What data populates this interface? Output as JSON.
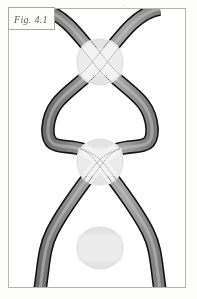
{
  "figure": {
    "label": "Fig. 4.1",
    "label_prefix": "Fig.",
    "label_number": "4.1",
    "alt": "Three-crossing braid diagram with highlighted crossing discs"
  },
  "frame": {
    "x": 8,
    "y": 8,
    "width": 178,
    "height": 280,
    "border_color": "#b4b4b0",
    "background_color": "#ffffff"
  },
  "page": {
    "background_color": "#fdfdfb",
    "width": 197,
    "height": 299
  },
  "colors": {
    "strand_fill": "#8f8f8f",
    "strand_edge_dark": "#141414",
    "strand_fill_light": "#b9b9b9",
    "disc_fill": "#e2e2e2",
    "disc_band": "#efefef",
    "dotted_outline": "#3a3a3a",
    "label_border": "#a8a8a4",
    "label_text": "#5d5d5b"
  },
  "diagram": {
    "type": "braid",
    "strand_count": 2,
    "strand_width": 11,
    "crossing_count": 3,
    "axis_x": 100,
    "lobe_left_x": 47,
    "lobe_right_x": 153,
    "crossings": [
      {
        "index": 1,
        "label": "crossing-1",
        "center_x": 100,
        "center_y": 62,
        "disc_radius": 23,
        "over_strand": "right-to-left"
      },
      {
        "index": 2,
        "label": "crossing-2",
        "center_x": 100,
        "center_y": 162,
        "disc_radius": 23,
        "over_strand": "left-to-right"
      },
      {
        "index": 3,
        "label": "crossing-3",
        "center_x": 100,
        "center_y": 248,
        "disc_radius": 23,
        "over_strand": "right-to-left"
      }
    ],
    "strand_ends": {
      "top_left_x": 40,
      "top_right_x": 160,
      "bottom_left_x": 40,
      "bottom_right_x": 160
    }
  }
}
